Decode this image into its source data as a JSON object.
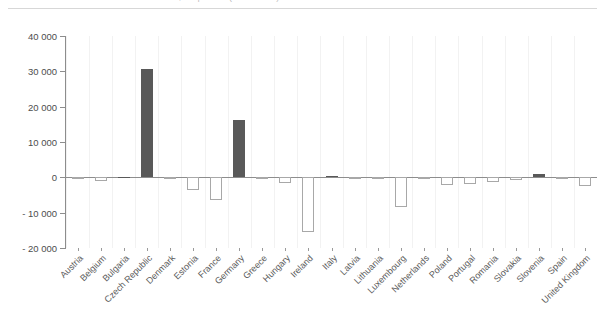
{
  "header": {
    "cropped_title": "EU Member States, net position (EUR million)"
  },
  "chart_data": {
    "type": "bar",
    "title": "",
    "xlabel": "",
    "ylabel": "",
    "ylim": [
      -20000,
      40000
    ],
    "yticks": [
      40000,
      30000,
      20000,
      10000,
      0,
      -10000,
      -20000
    ],
    "ytick_labels": [
      "40 000",
      "30 000",
      "20 000",
      "10 000",
      "0",
      "- 10 000",
      "- 20 000"
    ],
    "grid": "vertical-faint",
    "legend": "none",
    "colors": {
      "positive_bar": "#595959",
      "negative_bar_fill": "#ffffff",
      "negative_bar_border": "#a8a8a8",
      "axis": "#8d8d8d",
      "gridline": "#f2f2f2",
      "tick_label": "#4d4d4d"
    },
    "categories": [
      "Austria",
      "Belgium",
      "Bulgaria",
      "Czech Republic",
      "Denmark",
      "Estonia",
      "France",
      "Germany",
      "Greece",
      "Hungary",
      "Ireland",
      "Italy",
      "Latvia",
      "Lithuania",
      "Luxembourg",
      "Netherlands",
      "Poland",
      "Portugal",
      "Romania",
      "Slovakia",
      "Slovenia",
      "Spain",
      "United Kingdom"
    ],
    "values": [
      -300,
      -900,
      200,
      30800,
      -600,
      -3500,
      -6500,
      16200,
      -400,
      -1600,
      -15500,
      400,
      -300,
      -500,
      -8500,
      -300,
      -2200,
      -2000,
      -1400,
      -700,
      1000,
      -200,
      -2500
    ]
  }
}
